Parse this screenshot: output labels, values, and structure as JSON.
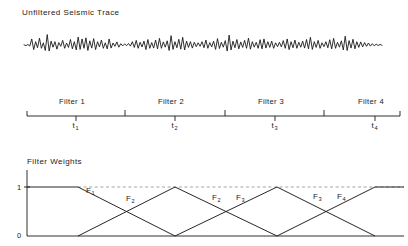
{
  "figure": {
    "width": 408,
    "height": 246,
    "background": "#ffffff",
    "stroke_color": "#1a1a1a",
    "dashed_color": "#9a9a9a"
  },
  "trace_panel": {
    "title": "Unfiltered Seismic Trace",
    "title_x": 22,
    "title_y": 8,
    "baseline_y": 45,
    "x_start": 24,
    "x_end": 382,
    "amplitude": 11,
    "samples": [
      0.02,
      -0.06,
      0.05,
      -0.1,
      0.55,
      -0.42,
      0.3,
      -0.25,
      0.62,
      -0.3,
      0.2,
      -0.5,
      0.95,
      -0.55,
      0.35,
      -0.2,
      0.3,
      -0.38,
      0.22,
      -0.12,
      0.42,
      -0.3,
      0.18,
      -0.22,
      0.5,
      -0.35,
      0.3,
      -0.45,
      0.72,
      -0.4,
      0.55,
      -0.3,
      0.65,
      -0.5,
      0.38,
      -0.28,
      0.58,
      -0.42,
      0.3,
      -0.18,
      0.45,
      -0.3,
      0.2,
      -0.35,
      0.55,
      -0.28,
      0.18,
      -0.12,
      0.28,
      -0.2,
      0.12,
      -0.08,
      0.1,
      -0.06,
      0.14,
      -0.1,
      0.3,
      -0.22,
      0.42,
      -0.3,
      0.25,
      -0.18,
      0.35,
      -0.42,
      0.5,
      -0.3,
      0.22,
      -0.28,
      0.45,
      -0.35,
      0.6,
      -0.3,
      0.28,
      -0.2,
      0.38,
      -0.5,
      0.85,
      -0.4,
      0.3,
      -0.25,
      0.52,
      -0.38,
      0.7,
      -0.45,
      0.35,
      -0.22,
      0.3,
      -0.28,
      0.25,
      -0.15,
      0.2,
      -0.12,
      0.3,
      -0.25,
      0.45,
      -0.3,
      0.22,
      -0.18,
      0.35,
      -0.4,
      0.58,
      -0.32,
      0.25,
      -0.2,
      0.4,
      -0.55,
      0.9,
      -0.45,
      0.35,
      -0.25,
      0.5,
      -0.35,
      0.28,
      -0.22,
      0.42,
      -0.3,
      0.62,
      -0.38,
      0.3,
      -0.2,
      0.25,
      -0.3,
      0.48,
      -0.35,
      0.55,
      -0.28,
      0.3,
      -0.22,
      0.35,
      -0.3,
      0.2,
      -0.15,
      0.25,
      -0.18,
      0.4,
      -0.3,
      0.55,
      -0.42,
      0.3,
      -0.25,
      0.45,
      -0.3,
      0.25,
      -0.2,
      0.35,
      -0.28,
      0.5,
      -0.35,
      0.7,
      -0.4,
      0.3,
      -0.22,
      0.42,
      -0.3,
      0.2,
      -0.15,
      0.3,
      -0.25,
      0.48,
      -0.35,
      0.6,
      -0.3,
      0.25,
      -0.2,
      0.38,
      -0.45,
      0.8,
      -0.5,
      0.4,
      -0.28,
      0.52,
      -0.35,
      0.3,
      -0.22,
      0.28,
      -0.18,
      0.22,
      -0.12,
      0.18,
      -0.1,
      0.12,
      -0.08,
      0.08,
      -0.05,
      0.05,
      -0.03
    ]
  },
  "timeline_panel": {
    "axis_y": 116,
    "x_start": 27,
    "x_end": 400,
    "end_cap_height": 5,
    "ticks": [
      {
        "x": 27,
        "type": "end"
      },
      {
        "x": 76,
        "type": "minor"
      },
      {
        "x": 125,
        "type": "major"
      },
      {
        "x": 175,
        "type": "minor"
      },
      {
        "x": 225,
        "type": "major"
      },
      {
        "x": 275,
        "type": "minor"
      },
      {
        "x": 324,
        "type": "major"
      },
      {
        "x": 375,
        "type": "minor"
      },
      {
        "x": 400,
        "type": "end"
      }
    ],
    "filter_labels": [
      {
        "text": "Filter 1",
        "x": 76,
        "y": 97
      },
      {
        "text": "Filter 2",
        "x": 175,
        "y": 97
      },
      {
        "text": "Filter 3",
        "x": 275,
        "y": 97
      },
      {
        "text": "Filter 4",
        "x": 375,
        "y": 97
      }
    ],
    "time_labels": [
      {
        "base": "t",
        "sub": "1",
        "x": 76,
        "y": 121
      },
      {
        "base": "t",
        "sub": "2",
        "x": 175,
        "y": 121
      },
      {
        "base": "t",
        "sub": "3",
        "x": 275,
        "y": 121
      },
      {
        "base": "t",
        "sub": "4",
        "x": 375,
        "y": 121
      }
    ]
  },
  "weights_panel": {
    "title": "Filter Weights",
    "title_x": 27,
    "title_y": 157,
    "axis_x": 27,
    "y_top": 170,
    "y_one": 187,
    "y_zero": 236,
    "x_end": 404,
    "y_labels": [
      {
        "text": "1",
        "x": 17,
        "y": 183
      },
      {
        "text": "0",
        "x": 17,
        "y": 231
      }
    ],
    "dashed_guide": {
      "x1": 78,
      "x2": 404,
      "y": 187
    },
    "series": [
      {
        "name": "F1",
        "points": [
          [
            27,
            187
          ],
          [
            78,
            187
          ],
          [
            175,
            236
          ]
        ]
      },
      {
        "name": "F2",
        "points": [
          [
            78,
            236
          ],
          [
            175,
            187
          ],
          [
            277,
            236
          ]
        ]
      },
      {
        "name": "F3",
        "points": [
          [
            175,
            236
          ],
          [
            277,
            187
          ],
          [
            375,
            236
          ]
        ]
      },
      {
        "name": "F4",
        "points": [
          [
            277,
            236
          ],
          [
            375,
            187
          ],
          [
            404,
            187
          ]
        ]
      }
    ],
    "curve_labels": [
      {
        "base": "F",
        "sub": "1",
        "x": 86,
        "y": 186
      },
      {
        "base": "F",
        "sub": "2",
        "x": 126,
        "y": 194
      },
      {
        "base": "F",
        "sub": "2",
        "x": 212,
        "y": 193
      },
      {
        "base": "F",
        "sub": "3",
        "x": 236,
        "y": 193
      },
      {
        "base": "F",
        "sub": "3",
        "x": 313,
        "y": 192
      },
      {
        "base": "F",
        "sub": "4",
        "x": 337,
        "y": 192
      }
    ]
  },
  "chart_data": {
    "type": "line",
    "panels": [
      {
        "type": "line",
        "title": "Unfiltered Seismic Trace",
        "xlabel": "",
        "ylabel": "",
        "description": "Raw oscillatory seismic wiggle trace plotted about a zero baseline"
      },
      {
        "type": "line",
        "title": "Filter application time axis",
        "categories": [
          "Filter 1",
          "Filter 2",
          "Filter 3",
          "Filter 4"
        ],
        "x": [
          "t1",
          "t2",
          "t3",
          "t4"
        ],
        "tick_values": [
          0,
          1,
          2,
          3,
          4,
          5,
          6,
          7,
          8
        ],
        "xlabel": "",
        "ylabel": ""
      },
      {
        "type": "line",
        "title": "Filter Weights",
        "ylabel": "",
        "xlabel": "",
        "ylim": [
          0,
          1
        ],
        "ytick_labels": [
          "0",
          "1"
        ],
        "grid": false,
        "legend": "inline-annotations",
        "series": [
          {
            "name": "F1",
            "x": [
              0,
              1,
              2
            ],
            "values": [
              1,
              1,
              0
            ]
          },
          {
            "name": "F2",
            "x": [
              1,
              2,
              3
            ],
            "values": [
              0,
              1,
              0
            ]
          },
          {
            "name": "F3",
            "x": [
              2,
              3,
              4
            ],
            "values": [
              0,
              1,
              0
            ]
          },
          {
            "name": "F4",
            "x": [
              3,
              4,
              4.3
            ],
            "values": [
              0,
              1,
              1
            ]
          }
        ],
        "annotations": [
          "F1",
          "F2",
          "F2",
          "F3",
          "F3",
          "F4"
        ]
      }
    ]
  }
}
